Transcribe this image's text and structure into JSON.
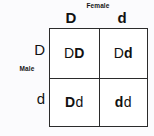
{
  "figure": {
    "type": "punnett-square",
    "female_label": "Female",
    "male_label": "Male",
    "female_alleles": [
      "D",
      "d"
    ],
    "male_alleles": [
      "D",
      "d"
    ],
    "cells": [
      {
        "genotype": "DD",
        "male_allele": "D",
        "female_allele": "D",
        "male_weight": "regular",
        "female_weight": "bold"
      },
      {
        "genotype": "Dd",
        "male_allele": "D",
        "female_allele": "d",
        "male_weight": "regular",
        "female_weight": "bold"
      },
      {
        "genotype": "Dd",
        "male_allele": "D",
        "female_allele": "d",
        "male_weight": "bold",
        "female_weight": "regular"
      },
      {
        "genotype": "dd",
        "male_allele": "d",
        "female_allele": "d",
        "male_weight": "bold",
        "female_weight": "regular"
      }
    ],
    "colors": {
      "background": "#fbfbfd",
      "cell_fill": "#ffffff",
      "border": "#2b2b2b",
      "text": "#111111"
    }
  }
}
